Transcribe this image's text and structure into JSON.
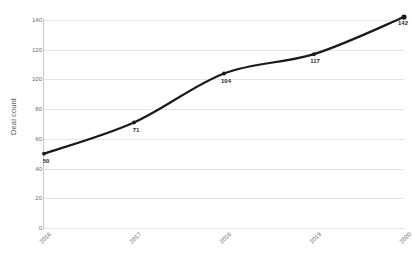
{
  "chart_data": {
    "type": "line",
    "title": "",
    "xlabel": "",
    "ylabel": "Deal count",
    "categories": [
      "2016",
      "2017",
      "2018",
      "2019",
      "2020"
    ],
    "values": [
      50,
      71,
      104,
      117,
      142
    ],
    "point_labels": [
      "50",
      "71",
      "104",
      "117",
      "142"
    ],
    "ylim": [
      0,
      140
    ],
    "y_ticks": [
      "0",
      "20",
      "40",
      "60",
      "80",
      "100",
      "120",
      "140"
    ],
    "y_tick_values": [
      0,
      20,
      40,
      60,
      80,
      100,
      120,
      140
    ],
    "grid": "horizontal",
    "legend": "none",
    "series": [
      {
        "name": "Deal count",
        "values": [
          50,
          71,
          104,
          117,
          142
        ],
        "color": "#1a1a1a",
        "marker": "circle",
        "smooth": true
      }
    ],
    "colors": {
      "line": "#1a1a1a",
      "marker": "#1a1a1a",
      "grid": "#e4e4e4",
      "axis": "#c9c9c9",
      "tick_text": "#6b6b6b",
      "label_text": "#2b2b2b",
      "background": "#ffffff"
    }
  }
}
